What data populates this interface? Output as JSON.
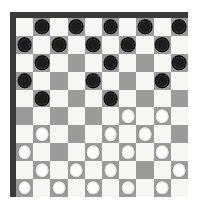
{
  "app": {
    "title": "Draughts Board",
    "board_kind": "international-draughts-10x10"
  },
  "board": {
    "rows": 10,
    "cols": 10,
    "light_square_color": "#f6f6f4",
    "dark_square_color": "#9b9b9b",
    "border_color": "#3a3a3a",
    "background_color": "#ffffff",
    "dark_piece_color": "#1c1c1c",
    "light_piece_color": "#fdfdfd",
    "dark_square_parity_note": "square is dark when (row + col) is odd",
    "piece_counts": {
      "dark": 27,
      "light": 26,
      "empty": 47
    },
    "piece_icon_names": {
      "dark": "dark-checker-piece-icon",
      "light": "light-checker-piece-icon"
    },
    "cells": [
      [
        null,
        "dark",
        null,
        "dark",
        null,
        "dark",
        null,
        "dark",
        null,
        "dark"
      ],
      [
        "dark",
        null,
        "dark",
        null,
        "dark",
        null,
        "dark",
        null,
        "dark",
        null
      ],
      [
        null,
        "dark",
        null,
        null,
        null,
        "dark",
        null,
        null,
        null,
        "dark"
      ],
      [
        "dark",
        null,
        null,
        null,
        "dark",
        null,
        null,
        null,
        "dark",
        null
      ],
      [
        null,
        "dark",
        null,
        null,
        null,
        "dark",
        null,
        null,
        null,
        null
      ],
      [
        null,
        null,
        null,
        null,
        null,
        null,
        "light",
        null,
        "light",
        null
      ],
      [
        null,
        "light",
        null,
        null,
        null,
        "light",
        null,
        "light",
        null,
        null
      ],
      [
        "light",
        null,
        null,
        null,
        "light",
        null,
        "light",
        null,
        "light",
        null
      ],
      [
        null,
        "light",
        null,
        "light",
        null,
        "light",
        null,
        null,
        null,
        "light"
      ],
      [
        "light",
        null,
        "light",
        null,
        "light",
        null,
        "light",
        null,
        "light",
        null
      ]
    ]
  }
}
